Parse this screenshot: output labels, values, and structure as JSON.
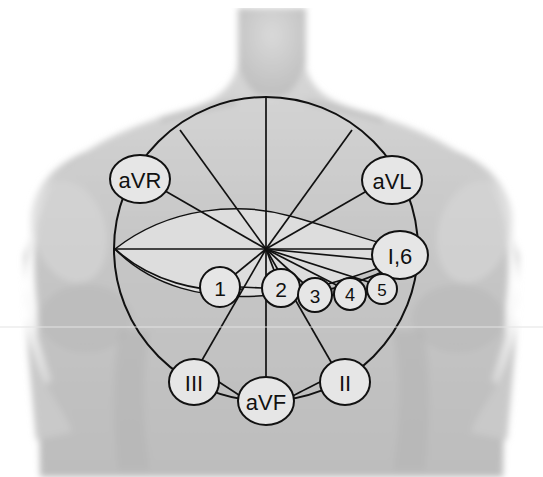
{
  "figure": {
    "background_color": "#ffffff",
    "skin_color": "#c9c9c9",
    "line_color": "#111111",
    "node_fill": "#e6e6e6",
    "lens_fill": "#dddddd"
  },
  "geometry": {
    "hub": {
      "x": 266,
      "y": 249
    },
    "circle": {
      "cx": 266,
      "cy": 249,
      "r": 152
    }
  },
  "limb_leads": [
    {
      "id": "aVR",
      "label": "aVR",
      "x": 140,
      "y": 179,
      "rx": 30,
      "ry": 24,
      "font": 22
    },
    {
      "id": "aVL",
      "label": "aVL",
      "x": 392,
      "y": 180,
      "rx": 30,
      "ry": 24,
      "font": 22
    },
    {
      "id": "I6",
      "label": "I,6",
      "x": 400,
      "y": 255,
      "rx": 28,
      "ry": 24,
      "font": 22
    },
    {
      "id": "III",
      "label": "III",
      "x": 194,
      "y": 382,
      "rx": 25,
      "ry": 23,
      "font": 22
    },
    {
      "id": "aVF",
      "label": "aVF",
      "x": 266,
      "y": 401,
      "rx": 28,
      "ry": 24,
      "font": 22
    },
    {
      "id": "II",
      "label": "II",
      "x": 345,
      "y": 382,
      "rx": 25,
      "ry": 23,
      "font": 22
    }
  ],
  "chest_leads": [
    {
      "id": "V1",
      "label": "1",
      "x": 220,
      "y": 287,
      "r": 20,
      "font": 21
    },
    {
      "id": "V2",
      "label": "2",
      "x": 281,
      "y": 288,
      "r": 19,
      "font": 21
    },
    {
      "id": "V3",
      "label": "3",
      "x": 315,
      "y": 295,
      "r": 17,
      "font": 19
    },
    {
      "id": "V4",
      "label": "4",
      "x": 350,
      "y": 294,
      "r": 16,
      "font": 18
    },
    {
      "id": "V5",
      "label": "5",
      "x": 382,
      "y": 289,
      "r": 15,
      "font": 17
    }
  ],
  "spokes": [
    {
      "id": "spoke-up",
      "angle_deg": -90
    },
    {
      "id": "spoke-upleft",
      "angle_deg": -150
    },
    {
      "id": "spoke-upright",
      "angle_deg": -30
    },
    {
      "id": "spoke-left",
      "angle_deg": 180
    },
    {
      "id": "spoke-right",
      "angle_deg": 0
    },
    {
      "id": "spoke-downleft",
      "angle_deg": 120
    },
    {
      "id": "spoke-down",
      "angle_deg": 90
    },
    {
      "id": "spoke-downright",
      "angle_deg": 60
    }
  ]
}
